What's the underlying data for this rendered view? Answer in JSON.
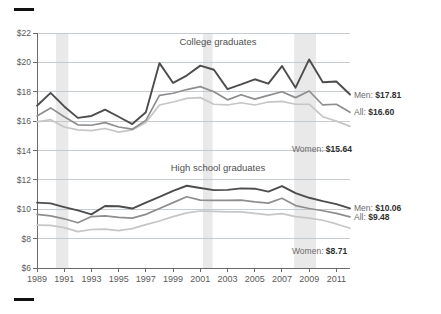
{
  "chart_data": {
    "type": "line",
    "title": "",
    "subtitle": "",
    "xlabel": "",
    "ylabel": "",
    "grid": true,
    "legend_position": "inline-right",
    "x": [
      1989,
      1990,
      1991,
      1992,
      1993,
      1994,
      1995,
      1996,
      1997,
      1998,
      1999,
      2000,
      2001,
      2002,
      2003,
      2004,
      2005,
      2006,
      2007,
      2008,
      2009,
      2010,
      2011,
      2012
    ],
    "xtick_labels": [
      "1989",
      "1991",
      "1993",
      "1995",
      "1997",
      "1999",
      "2001",
      "2003",
      "2005",
      "2007",
      "2009",
      "2011"
    ],
    "xlim": [
      1989,
      2012
    ],
    "ylim": [
      6,
      22
    ],
    "ytick_labels": [
      "$6",
      "$8",
      "$10",
      "$12",
      "$14",
      "$16",
      "$18",
      "$20",
      "$22"
    ],
    "ytick_values": [
      6,
      8,
      10,
      12,
      14,
      16,
      18,
      20,
      22
    ],
    "panels": [
      {
        "name": "college-graduates",
        "title": "College graduates",
        "series": [
          {
            "name": "Men",
            "color": "#4d4d4d",
            "end_label": "Men:",
            "end_value": "$17.81",
            "values": [
              17.05,
              17.92,
              17.0,
              16.22,
              16.35,
              16.78,
              16.3,
              15.8,
              16.6,
              19.95,
              18.6,
              19.1,
              19.78,
              19.5,
              18.18,
              18.5,
              18.85,
              18.55,
              19.75,
              18.28,
              20.2,
              18.65,
              18.7,
              17.81
            ]
          },
          {
            "name": "All",
            "color": "#8e8e8e",
            "end_label": "All:",
            "end_value": "$16.60",
            "values": [
              16.35,
              16.9,
              16.3,
              15.75,
              15.72,
              15.9,
              15.6,
              15.45,
              16.05,
              17.75,
              17.9,
              18.15,
              18.35,
              18.0,
              17.45,
              17.8,
              17.5,
              17.75,
              18.0,
              17.6,
              18.05,
              17.1,
              17.15,
              16.6
            ]
          },
          {
            "name": "Women",
            "color": "#c6c6c6",
            "end_label": "Women:",
            "end_value": "$15.64",
            "values": [
              15.95,
              16.1,
              15.6,
              15.4,
              15.35,
              15.5,
              15.25,
              15.4,
              15.9,
              17.1,
              17.3,
              17.55,
              17.6,
              17.15,
              17.1,
              17.25,
              17.1,
              17.3,
              17.35,
              17.15,
              17.15,
              16.3,
              16.0,
              15.64
            ]
          }
        ]
      },
      {
        "name": "high-school-graduates",
        "title": "High school graduates",
        "series": [
          {
            "name": "Men",
            "color": "#4d4d4d",
            "end_label": "Men:",
            "end_value": "$10.06",
            "values": [
              10.45,
              10.4,
              10.15,
              9.92,
              9.65,
              10.22,
              10.2,
              10.05,
              10.45,
              10.85,
              11.25,
              11.6,
              11.45,
              11.3,
              11.32,
              11.42,
              11.4,
              11.2,
              11.58,
              11.1,
              10.78,
              10.55,
              10.35,
              10.06
            ]
          },
          {
            "name": "All",
            "color": "#8e8e8e",
            "end_label": "All:",
            "end_value": "$9.48",
            "values": [
              9.65,
              9.55,
              9.35,
              9.08,
              9.5,
              9.55,
              9.45,
              9.4,
              9.65,
              10.05,
              10.45,
              10.85,
              10.62,
              10.6,
              10.6,
              10.62,
              10.5,
              10.42,
              10.75,
              10.25,
              10.05,
              9.9,
              9.72,
              9.48
            ]
          },
          {
            "name": "Women",
            "color": "#c6c6c6",
            "end_label": "Women:",
            "end_value": "$8.71",
            "values": [
              8.92,
              8.9,
              8.75,
              8.48,
              8.62,
              8.65,
              8.55,
              8.68,
              8.95,
              9.2,
              9.5,
              9.75,
              9.88,
              9.85,
              9.82,
              9.82,
              9.72,
              9.62,
              9.7,
              9.5,
              9.4,
              9.25,
              9.0,
              8.71
            ]
          }
        ]
      }
    ],
    "recession_bands": [
      {
        "name": "recession-1990-1991",
        "start": 1990.4,
        "end": 1991.3
      },
      {
        "name": "recession-2001",
        "start": 2001.2,
        "end": 2001.9
      },
      {
        "name": "recession-2008-2009",
        "start": 2007.9,
        "end": 2009.5
      }
    ]
  }
}
